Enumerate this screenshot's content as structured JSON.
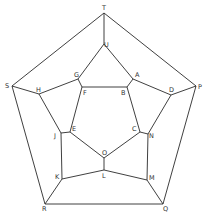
{
  "diagram": {
    "type": "graph",
    "line_color": "#2a2a2a",
    "label_color": "#333333",
    "background": "#ffffff",
    "vertices": [
      {
        "id": "T",
        "x": 104,
        "y": 13,
        "lx": 102,
        "ly": 10,
        "label": "T"
      },
      {
        "id": "U",
        "x": 104,
        "y": 44,
        "lx": 104,
        "ly": 47,
        "label": "U"
      },
      {
        "id": "S",
        "x": 12,
        "y": 86,
        "lx": 5,
        "ly": 88,
        "label": "S"
      },
      {
        "id": "P",
        "x": 196,
        "y": 86,
        "lx": 198,
        "ly": 89,
        "label": "P"
      },
      {
        "id": "G",
        "x": 78,
        "y": 79,
        "lx": 74,
        "ly": 77,
        "label": "G"
      },
      {
        "id": "A",
        "x": 133,
        "y": 79,
        "lx": 135,
        "ly": 77,
        "label": "A"
      },
      {
        "id": "H",
        "x": 39,
        "y": 94,
        "lx": 36,
        "ly": 92,
        "label": "H"
      },
      {
        "id": "D",
        "x": 171,
        "y": 95,
        "lx": 169,
        "ly": 92,
        "label": "D"
      },
      {
        "id": "F",
        "x": 82,
        "y": 87,
        "lx": 83,
        "ly": 95,
        "label": "F"
      },
      {
        "id": "B",
        "x": 127,
        "y": 87,
        "lx": 121,
        "ly": 95,
        "label": "B"
      },
      {
        "id": "J",
        "x": 61,
        "y": 133,
        "lx": 54,
        "ly": 138,
        "label": "J"
      },
      {
        "id": "E",
        "x": 70,
        "y": 132,
        "lx": 72,
        "ly": 131,
        "label": "E"
      },
      {
        "id": "C",
        "x": 140,
        "y": 132,
        "lx": 132,
        "ly": 131,
        "label": "C"
      },
      {
        "id": "N",
        "x": 148,
        "y": 134,
        "lx": 149,
        "ly": 138,
        "label": "N"
      },
      {
        "id": "O",
        "x": 104,
        "y": 158,
        "lx": 102,
        "ly": 155,
        "label": "O"
      },
      {
        "id": "L",
        "x": 104,
        "y": 170,
        "lx": 102,
        "ly": 178,
        "label": "L"
      },
      {
        "id": "K",
        "x": 62,
        "y": 179,
        "lx": 55,
        "ly": 179,
        "label": "K"
      },
      {
        "id": "M",
        "x": 147,
        "y": 180,
        "lx": 149,
        "ly": 180,
        "label": "M"
      },
      {
        "id": "R",
        "x": 45,
        "y": 204,
        "lx": 42,
        "ly": 211,
        "label": "R"
      },
      {
        "id": "Q",
        "x": 163,
        "y": 204,
        "lx": 163,
        "ly": 211,
        "label": "Q"
      }
    ],
    "edges": [
      [
        "T",
        "S"
      ],
      [
        "T",
        "P"
      ],
      [
        "T",
        "U"
      ],
      [
        "S",
        "R"
      ],
      [
        "P",
        "Q"
      ],
      [
        "R",
        "Q"
      ],
      [
        "S",
        "H"
      ],
      [
        "P",
        "D"
      ],
      [
        "R",
        "K"
      ],
      [
        "Q",
        "M"
      ],
      [
        "U",
        "G"
      ],
      [
        "U",
        "A"
      ],
      [
        "G",
        "H"
      ],
      [
        "A",
        "D"
      ],
      [
        "H",
        "J"
      ],
      [
        "D",
        "N"
      ],
      [
        "J",
        "K"
      ],
      [
        "N",
        "M"
      ],
      [
        "K",
        "L"
      ],
      [
        "M",
        "L"
      ],
      [
        "G",
        "F"
      ],
      [
        "A",
        "B"
      ],
      [
        "F",
        "B"
      ],
      [
        "F",
        "E"
      ],
      [
        "B",
        "C"
      ],
      [
        "J",
        "E"
      ],
      [
        "C",
        "N"
      ],
      [
        "E",
        "O"
      ],
      [
        "C",
        "O"
      ],
      [
        "O",
        "L"
      ]
    ]
  }
}
